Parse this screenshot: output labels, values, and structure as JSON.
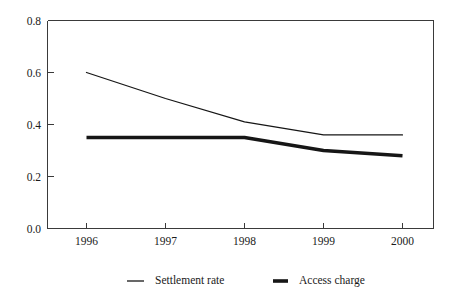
{
  "chart_data": {
    "type": "line",
    "title": "",
    "subtitle": "",
    "xlabel": "",
    "ylabel": "",
    "categories": [
      "1996",
      "1997",
      "1998",
      "1999",
      "2000"
    ],
    "x": [
      1996,
      1997,
      1998,
      1999,
      2000
    ],
    "series": [
      {
        "name": "Settlement rate",
        "values": [
          0.6,
          0.5,
          0.41,
          0.36,
          0.36
        ],
        "style": "thin-line",
        "color": "#161616"
      },
      {
        "name": "Access charge",
        "values": [
          0.35,
          0.35,
          0.35,
          0.3,
          0.28
        ],
        "style": "thick-line",
        "color": "#161616"
      }
    ],
    "ylim": [
      0.0,
      0.8
    ],
    "y_ticks": [
      "0.0",
      "0.2",
      "0.4",
      "0.6",
      "0.8"
    ],
    "y_tick_values": [
      0.0,
      0.2,
      0.4,
      0.6,
      0.8
    ],
    "x_ticks": [
      "1996",
      "1997",
      "1998",
      "1999",
      "2000"
    ],
    "grid": false,
    "legend_position": "bottom",
    "legend": [
      {
        "label": "Settlement rate",
        "marker": "thin-line"
      },
      {
        "label": "Access charge",
        "marker": "thick-line"
      }
    ],
    "axis_color": "#3a3a3a",
    "background_color": "#ffffff"
  }
}
